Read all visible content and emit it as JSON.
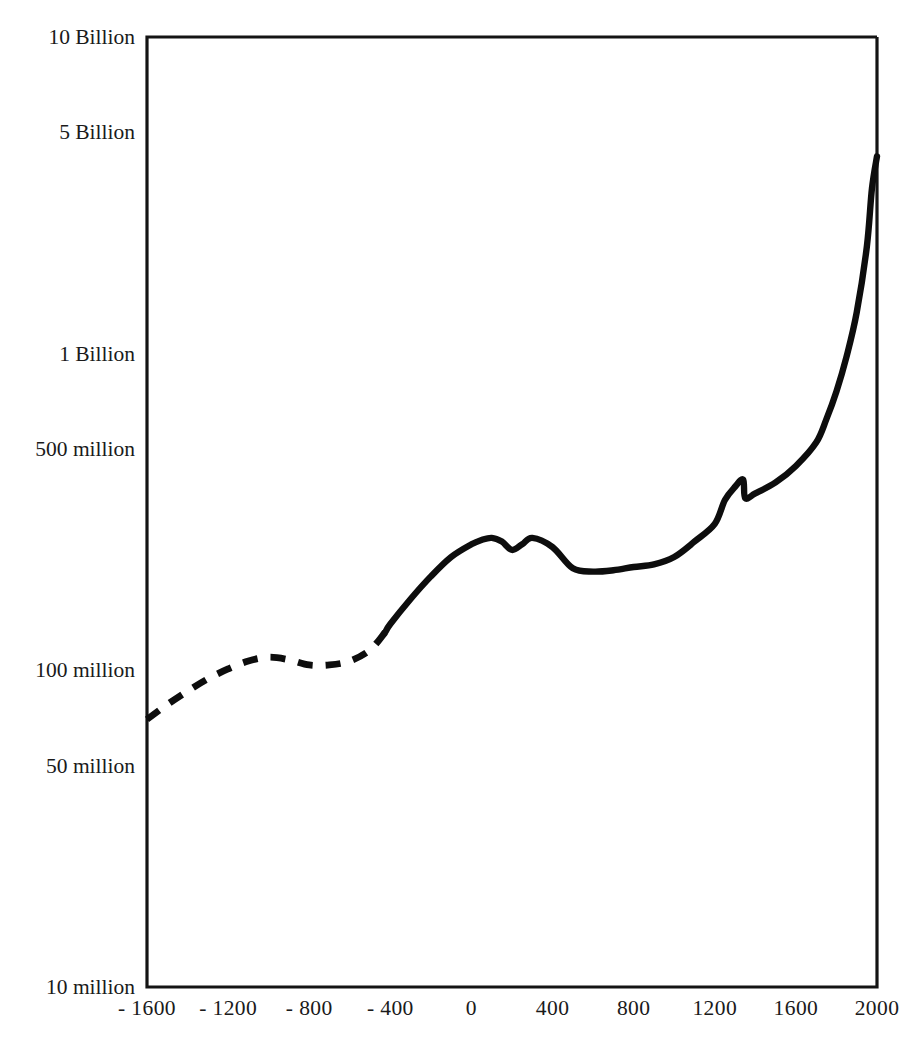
{
  "chart_data": {
    "type": "line",
    "title": "",
    "subtitle": "",
    "xlabel": "",
    "ylabel": "",
    "yscale": "log",
    "xlim": [
      -1600,
      2000
    ],
    "ylim": [
      10000000,
      10000000000
    ],
    "grid": false,
    "legend": null,
    "x_ticks": [
      {
        "value": -1600,
        "label": "- 1600"
      },
      {
        "value": -1200,
        "label": "- 1200"
      },
      {
        "value": -800,
        "label": "- 800"
      },
      {
        "value": -400,
        "label": "- 400"
      },
      {
        "value": 0,
        "label": "0"
      },
      {
        "value": 400,
        "label": "400"
      },
      {
        "value": 800,
        "label": "800"
      },
      {
        "value": 1200,
        "label": "1200"
      },
      {
        "value": 1600,
        "label": "1600"
      },
      {
        "value": 2000,
        "label": "2000"
      }
    ],
    "y_ticks": [
      {
        "value": 10000000000,
        "label": "10 Billion"
      },
      {
        "value": 5000000000,
        "label": "5 Billion"
      },
      {
        "value": 1000000000,
        "label": "1 Billion"
      },
      {
        "value": 500000000,
        "label": "500 million"
      },
      {
        "value": 100000000,
        "label": "100 million"
      },
      {
        "value": 50000000,
        "label": "50 million"
      },
      {
        "value": 10000000,
        "label": "10 million"
      }
    ],
    "series": [
      {
        "name": "World population (estimated)",
        "style": "dashed",
        "color": "#0d0d0d",
        "x": [
          -1600,
          -1500,
          -1400,
          -1300,
          -1200,
          -1100,
          -1000,
          -900,
          -800,
          -700,
          -600,
          -500,
          -425
        ],
        "values": [
          70000000,
          78000000,
          86000000,
          94000000,
          101000000,
          107000000,
          110000000,
          108000000,
          104000000,
          104000000,
          107000000,
          116000000,
          132000000
        ]
      },
      {
        "name": "World population (recorded)",
        "style": "solid",
        "color": "#0d0d0d",
        "x": [
          -425,
          -400,
          -300,
          -200,
          -100,
          0,
          50,
          100,
          150,
          200,
          250,
          300,
          400,
          500,
          600,
          700,
          800,
          900,
          1000,
          1100,
          1200,
          1250,
          1300,
          1340,
          1350,
          1400,
          1500,
          1600,
          1700,
          1750,
          1800,
          1850,
          1900,
          1950,
          1975,
          2000
        ],
        "values": [
          132000000,
          140000000,
          168000000,
          198000000,
          228000000,
          250000000,
          258000000,
          262000000,
          255000000,
          240000000,
          250000000,
          262000000,
          245000000,
          210000000,
          205000000,
          207000000,
          212000000,
          216000000,
          228000000,
          255000000,
          290000000,
          345000000,
          380000000,
          400000000,
          350000000,
          362000000,
          392000000,
          442000000,
          524000000,
          620000000,
          760000000,
          980000000,
          1350000000,
          2180000000,
          3320000000,
          4200000000
        ]
      }
    ],
    "annotations": [
      {
        "x": 150,
        "label": "Antonine plague dip"
      },
      {
        "x": 1350,
        "label": "Black Death dip"
      }
    ]
  },
  "axes": {
    "frame_color": "#141414",
    "curve_color": "#0d0d0d",
    "background": "#ffffff"
  }
}
